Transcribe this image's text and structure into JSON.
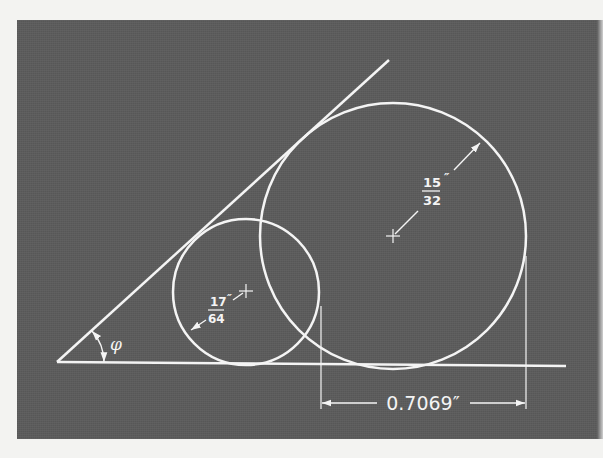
{
  "figure": {
    "background_color": "#5c5c5c",
    "line_color": "#f4f4f4",
    "page_color": "#f3f3f1"
  },
  "labels": {
    "angle_symbol": "φ",
    "large_circle_radius": {
      "numerator": "15",
      "denominator": "32",
      "unit": "″"
    },
    "small_circle_radius": {
      "numerator": "17",
      "denominator": "64",
      "unit": "″"
    },
    "center_distance": "0.7069″"
  },
  "geometry": {
    "baseline": {
      "x1": 57,
      "y1": 362,
      "x2": 566,
      "y2": 366
    },
    "angled_line": {
      "x1": 57,
      "y1": 362,
      "x2": 389,
      "y2": 60
    },
    "large_circle": {
      "cx": 393,
      "cy": 236,
      "r": 133
    },
    "small_circle": {
      "cx": 246,
      "cy": 292,
      "r": 73
    },
    "extension_lines": [
      {
        "x": 321,
        "y1": 306,
        "y2": 408
      },
      {
        "x": 526,
        "y1": 256,
        "y2": 408
      }
    ],
    "dimension_line_y": 403
  }
}
